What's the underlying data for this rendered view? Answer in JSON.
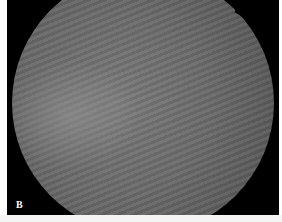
{
  "image": {
    "description": "Circular grayscale fundus-style image on black background with diagonal banded texture",
    "panel_label": "B",
    "colors": {
      "background": "#000000",
      "border": "#ffffff",
      "disc_center": "#7a7a7a",
      "disc_edge": "#4e4e4e",
      "label": "#ffffff"
    }
  }
}
